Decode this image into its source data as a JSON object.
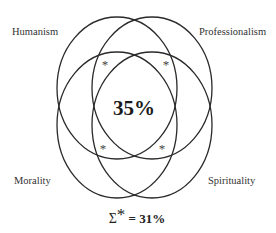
{
  "diagram": {
    "type": "venn",
    "sets": [
      {
        "name": "Humanism",
        "position": "top-left"
      },
      {
        "name": "Professionalism",
        "position": "top-right"
      },
      {
        "name": "Morality",
        "position": "bottom-left"
      },
      {
        "name": "Spirituality",
        "position": "bottom-right"
      }
    ],
    "center_value": "35%",
    "partial_overlap_marker": "*",
    "sum_label": {
      "symbol": "Σ",
      "marker": "*",
      "text": "= 31%"
    },
    "line_color": "#2a2a2a"
  }
}
